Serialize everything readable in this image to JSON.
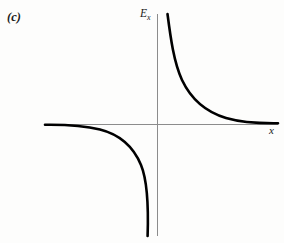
{
  "figure": {
    "panel_label": "(c)",
    "background_color": "#fdfdfc",
    "width": 284,
    "height": 243
  },
  "axes": {
    "x_label": "x",
    "y_label_base": "E",
    "y_label_subscript": "x",
    "axis_color": "#8c8c8c",
    "axis_width": 1,
    "origin": {
      "x": 157,
      "y": 124
    },
    "x_axis": {
      "x_start": 45,
      "x_end": 278,
      "y": 124
    },
    "y_axis": {
      "y_start": 14,
      "y_end": 236,
      "x": 157
    }
  },
  "curve": {
    "color": "#000000",
    "width": 2.6,
    "description": "inverse-square-like field profile E_x versus x with a pole at the origin",
    "upper_right_path": "M 167.5 14 C 170.6 38 173.8 62 182 80 C 191 99 206 112 226 118 C 243 123 262 123.4 278 123.2",
    "lower_left_path": "M 45 124.8 C 62 124.6 82 125 100 129.6 C 119 134.4 133 146 141 165 C 147.6 181 148.6 206 147.6 236"
  },
  "chart_data": {
    "type": "line",
    "title": "",
    "xlabel": "x",
    "ylabel": "E_x",
    "grid": false,
    "legend": null,
    "annotations": [
      "(c)"
    ],
    "xlim": [
      -2.3,
      2.4
    ],
    "ylim": [
      -2.3,
      2.3
    ],
    "asymptotes": {
      "vertical_x": 0,
      "horizontal_y": 0
    },
    "series": [
      {
        "name": "E_x upper-right branch",
        "x": [
          0.11,
          0.16,
          0.22,
          0.3,
          0.4,
          0.55,
          0.75,
          1.0,
          1.3,
          1.6,
          1.9,
          2.2,
          2.4
        ],
        "y": [
          2.3,
          1.75,
          1.3,
          0.97,
          0.73,
          0.53,
          0.39,
          0.29,
          0.22,
          0.18,
          0.15,
          0.13,
          0.12
        ]
      },
      {
        "name": "E_x lower-left branch",
        "x": [
          -2.3,
          -1.9,
          -1.6,
          -1.3,
          -1.0,
          -0.75,
          -0.55,
          -0.4,
          -0.3,
          -0.22,
          -0.16,
          -0.12,
          -0.1
        ],
        "y": [
          -0.12,
          -0.14,
          -0.17,
          -0.21,
          -0.28,
          -0.38,
          -0.52,
          -0.71,
          -0.95,
          -1.28,
          -1.72,
          -2.1,
          -2.3
        ]
      }
    ]
  }
}
